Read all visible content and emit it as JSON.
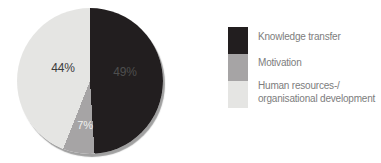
{
  "chart_data": {
    "type": "pie",
    "labels": [
      "Knowledge transfer",
      "Motivation",
      "Human resources-/ organisational development"
    ],
    "values": [
      49,
      7,
      44
    ],
    "colors": [
      "#221e1f",
      "#a6a4a5",
      "#e5e5e3"
    ],
    "slice_labels": [
      "49%",
      "7%",
      "44%"
    ],
    "start_angle_deg": 0,
    "direction": "clockwise",
    "legend_position": "right",
    "shadow_color": "#525252"
  },
  "legend": {
    "items": [
      {
        "label": "Knowledge transfer"
      },
      {
        "label": "Motivation"
      },
      {
        "label_line1": "Human resources-/",
        "label_line2": "organisational development"
      }
    ]
  }
}
